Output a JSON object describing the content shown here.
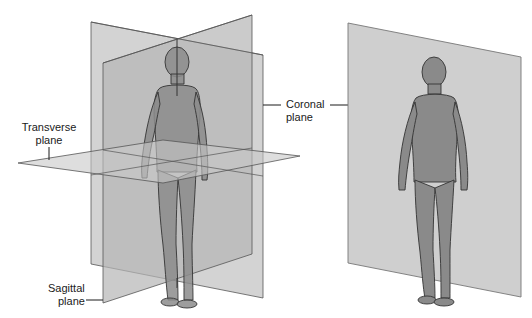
{
  "diagram": {
    "left_panel": {
      "description": "Three intersecting anatomical planes through a standing human figure",
      "labels": {
        "transverse": {
          "line1": "Transverse",
          "line2": "plane"
        },
        "sagittal": {
          "line1": "Sagittal",
          "line2": "plane"
        }
      }
    },
    "right_panel": {
      "description": "Single plane behind a standing human figure",
      "labels": {
        "coronal": {
          "line1": "Coronal",
          "line2": "plane"
        }
      }
    },
    "colors": {
      "background": "#ffffff",
      "plane_fill": "#bdbdbd",
      "plane_edge": "#555555",
      "body_fill": "#8a8a8a",
      "body_outline": "#333333",
      "text": "#1a1a1a"
    }
  }
}
